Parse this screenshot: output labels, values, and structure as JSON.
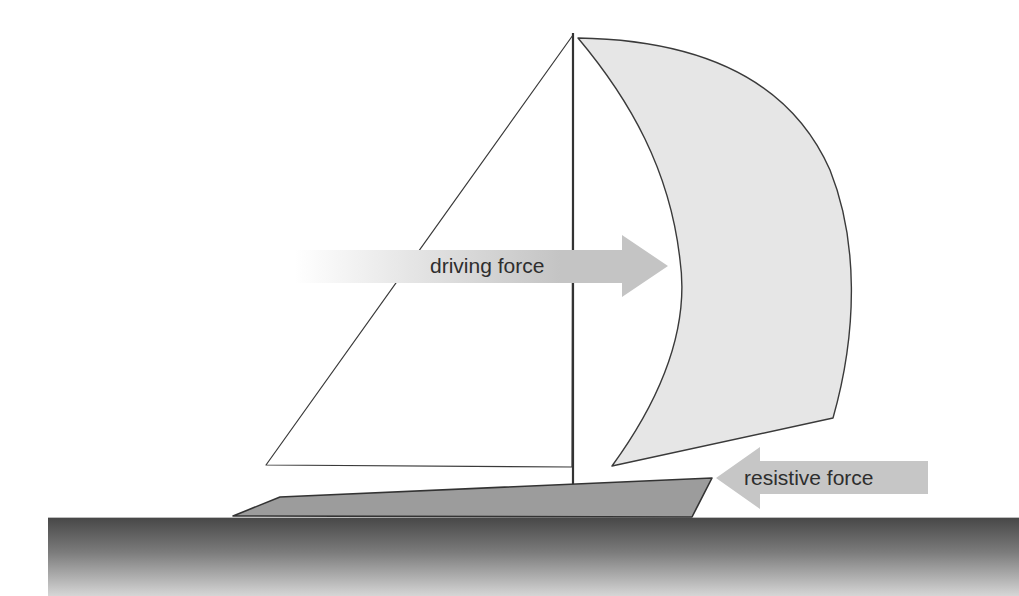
{
  "diagram": {
    "title": "",
    "labels": {
      "driving_force": "driving force",
      "resistive_force": "resistive force"
    },
    "colors": {
      "background": "#ffffff",
      "outline": "#3a3a3a",
      "spinnaker_fill": "#e6e6e6",
      "jib_fill": "#ffffff",
      "hull_fill": "#9a9a9a",
      "arrow_fill": "#c4c4c4",
      "water_top": "#4a4a4a",
      "water_bottom": "#d2d2d2",
      "text": "#2e2e2e"
    },
    "elements": [
      {
        "name": "mast",
        "type": "line"
      },
      {
        "name": "jib-sail",
        "type": "triangle"
      },
      {
        "name": "spinnaker-sail",
        "type": "curved-shape"
      },
      {
        "name": "hull",
        "type": "polygon"
      },
      {
        "name": "water",
        "type": "gradient-rectangle"
      },
      {
        "name": "driving-force-arrow",
        "direction": "right",
        "label": "driving force"
      },
      {
        "name": "resistive-force-arrow",
        "direction": "left",
        "label": "resistive force"
      }
    ]
  }
}
